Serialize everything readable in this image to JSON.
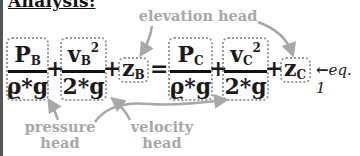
{
  "title": "Analysis:",
  "equation": {
    "terms": [
      {
        "id": "pressure-b",
        "numerator": "P",
        "num_sub": "B",
        "denominator": "ϱ*g"
      },
      {
        "id": "velocity-b",
        "numerator": "v",
        "num_sub": "B",
        "num_sup": "2",
        "denominator": "2*g"
      },
      {
        "id": "elevation-b",
        "symbol": "z",
        "sub": "B"
      },
      {
        "id": "pressure-c",
        "numerator": "P",
        "num_sub": "C",
        "denominator": "ϱ*g"
      },
      {
        "id": "velocity-c",
        "numerator": "v",
        "num_sub": "C",
        "num_sup": "2",
        "denominator": "2*g"
      },
      {
        "id": "elevation-c",
        "symbol": "z",
        "sub": "C"
      }
    ],
    "operators": {
      "plus": "+",
      "equals": "="
    },
    "label": "eq. 1"
  },
  "annotations": {
    "elevation_head": "elevation head",
    "pressure_head_line1": "pressure",
    "pressure_head_line2": "head",
    "velocity_head_line1": "velocity",
    "velocity_head_line2": "head"
  },
  "colors": {
    "annotation": "#a8a8a8",
    "box_border": "#9a9a9a",
    "text": "#111111"
  }
}
